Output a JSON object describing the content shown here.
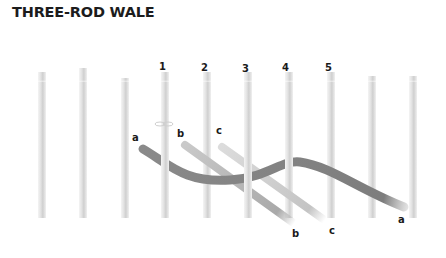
{
  "title": "THREE-ROD WALE",
  "diagram": {
    "rod_numbers": [
      "1",
      "2",
      "3",
      "4",
      "5"
    ],
    "weaver_start_labels": [
      "a",
      "b",
      "c"
    ],
    "weaver_end_labels": [
      "b",
      "c",
      "a"
    ],
    "colors": {
      "rod": "#d9d9d9",
      "weaver_a": "#808080",
      "weaver_b": "#b8b8b8",
      "weaver_c": "#d4d4d4",
      "label": "#1a1a1a"
    }
  }
}
